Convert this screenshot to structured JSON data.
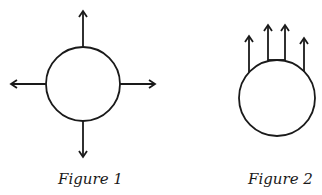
{
  "figures": [
    {
      "caption": "Figure 1",
      "description": "circle with four arrows pointing outward in all directions",
      "arrows": [
        "up",
        "down",
        "left",
        "right"
      ]
    },
    {
      "caption": "Figure 2",
      "description": "circle with four parallel arrows pointing upward from its top",
      "arrows": [
        "up",
        "up",
        "up",
        "up"
      ]
    }
  ],
  "colors": {
    "stroke": "#1a1a1a",
    "background": "#ffffff"
  }
}
